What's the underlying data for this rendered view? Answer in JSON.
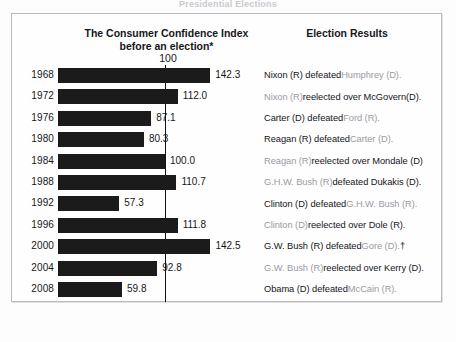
{
  "figure": {
    "top_caption": "Presidential Elections",
    "left_header_line1": "The Consumer Confidence Index",
    "left_header_line2": "before an election*",
    "right_header": "Election Results",
    "axis_tick_label": "100"
  },
  "chart_data": {
    "type": "bar",
    "title": "The Consumer Confidence Index before an election*",
    "xlabel": "",
    "ylabel": "",
    "orientation": "horizontal",
    "reference_line": 100,
    "reference_line_label": "100",
    "grid": false,
    "xlim": [
      0,
      150
    ],
    "categories": [
      "1968",
      "1972",
      "1976",
      "1980",
      "1984",
      "1988",
      "1992",
      "1996",
      "2000",
      "2004",
      "2008"
    ],
    "values": [
      142.3,
      112.0,
      87.1,
      80.3,
      100.0,
      110.7,
      57.3,
      111.8,
      142.5,
      92.8,
      59.8
    ],
    "value_labels": [
      "142.3",
      "112.0",
      "87.1",
      "80.3",
      "100.0",
      "110.7",
      "57.3",
      "111.8",
      "142.5",
      "92.8",
      "59.8"
    ],
    "bar_color": "#1b1b1b",
    "annotations": [
      "† disputed / popular-vote winner marker on 2000 row"
    ]
  },
  "results": [
    {
      "year": "1968",
      "parts": [
        {
          "text": "Nixon (R) defeated ",
          "tone": "dark"
        },
        {
          "text": "Humphrey (D).",
          "tone": "light"
        }
      ]
    },
    {
      "year": "1972",
      "parts": [
        {
          "text": "Nixon (R) ",
          "tone": "light"
        },
        {
          "text": "reelected over McGovern(D).",
          "tone": "dark"
        }
      ]
    },
    {
      "year": "1976",
      "parts": [
        {
          "text": "Carter (D) defeated ",
          "tone": "dark"
        },
        {
          "text": "Ford (R).",
          "tone": "light"
        }
      ]
    },
    {
      "year": "1980",
      "parts": [
        {
          "text": "Reagan (R) defeated ",
          "tone": "dark"
        },
        {
          "text": "Carter (D).",
          "tone": "light"
        }
      ]
    },
    {
      "year": "1984",
      "parts": [
        {
          "text": "Reagan (R) ",
          "tone": "light"
        },
        {
          "text": "reelected over Mondale (D)",
          "tone": "dark"
        }
      ]
    },
    {
      "year": "1988",
      "parts": [
        {
          "text": "G.H.W. Bush (R) ",
          "tone": "light"
        },
        {
          "text": "defeated Dukakis (D).",
          "tone": "dark"
        }
      ]
    },
    {
      "year": "1992",
      "parts": [
        {
          "text": "Clinton (D) defeated ",
          "tone": "dark"
        },
        {
          "text": "G.H.W. Bush (R).",
          "tone": "light"
        }
      ]
    },
    {
      "year": "1996",
      "parts": [
        {
          "text": "Clinton (D) ",
          "tone": "light"
        },
        {
          "text": "reelected over Dole (R).",
          "tone": "dark"
        }
      ]
    },
    {
      "year": "2000",
      "parts": [
        {
          "text": "G.W. Bush (R) defeated ",
          "tone": "dark"
        },
        {
          "text": "Gore (D).",
          "tone": "light"
        },
        {
          "text": "†",
          "tone": "dark"
        }
      ]
    },
    {
      "year": "2004",
      "parts": [
        {
          "text": "G.W. Bush (R) ",
          "tone": "light"
        },
        {
          "text": "reelected over Kerry (D).",
          "tone": "dark"
        }
      ]
    },
    {
      "year": "2008",
      "parts": [
        {
          "text": "Obama (D) defeated ",
          "tone": "dark"
        },
        {
          "text": "McCain (R).",
          "tone": "light"
        }
      ]
    }
  ]
}
